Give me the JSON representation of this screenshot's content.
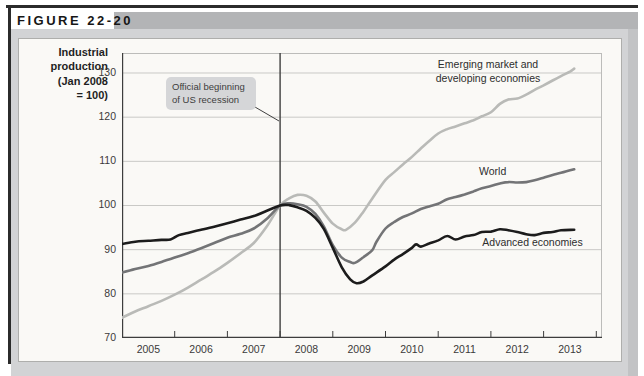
{
  "figure": {
    "label": "FIGURE 22-20"
  },
  "chart": {
    "y_axis_title": "Industrial\nproduction\n(Jan 2008\n= 100)",
    "annotation": "Official beginning\nof US recession"
  },
  "chart_data": {
    "type": "line",
    "title": "",
    "xlabel": "",
    "ylabel": "Industrial production (Jan 2008 = 100)",
    "ylim": [
      70,
      134.5
    ],
    "xlim": [
      2005,
      2014.1
    ],
    "yticks": [
      70,
      80,
      90,
      100,
      110,
      120,
      130
    ],
    "x_ticks": [
      2005,
      2006,
      2007,
      2008,
      2009,
      2010,
      2011,
      2012,
      2013
    ],
    "x_tick_marks": [
      2006,
      2007,
      2008,
      2009,
      2010,
      2011,
      2012,
      2013,
      2014
    ],
    "grid": true,
    "legend_position": "inline-labels",
    "annotations": [
      {
        "text": "Official beginning of US recession",
        "x": 2008.0
      }
    ],
    "series": [
      {
        "name": "Emerging market and developing economies",
        "color": "#b9bab7",
        "width": 2.6,
        "points": [
          [
            2005.0,
            74.6
          ],
          [
            2005.25,
            76.0
          ],
          [
            2005.5,
            77.2
          ],
          [
            2005.75,
            78.4
          ],
          [
            2006.0,
            79.8
          ],
          [
            2006.25,
            81.4
          ],
          [
            2006.5,
            83.2
          ],
          [
            2006.75,
            85.0
          ],
          [
            2007.0,
            87.0
          ],
          [
            2007.25,
            89.2
          ],
          [
            2007.5,
            91.5
          ],
          [
            2007.75,
            95.3
          ],
          [
            2008.0,
            100.0
          ],
          [
            2008.17,
            101.6
          ],
          [
            2008.33,
            102.4
          ],
          [
            2008.5,
            102.2
          ],
          [
            2008.67,
            100.9
          ],
          [
            2008.83,
            98.4
          ],
          [
            2009.0,
            95.9
          ],
          [
            2009.17,
            94.6
          ],
          [
            2009.25,
            94.5
          ],
          [
            2009.42,
            96.1
          ],
          [
            2009.58,
            98.6
          ],
          [
            2009.75,
            101.6
          ],
          [
            2010.0,
            105.8
          ],
          [
            2010.17,
            107.6
          ],
          [
            2010.33,
            109.3
          ],
          [
            2010.5,
            111.0
          ],
          [
            2010.67,
            112.9
          ],
          [
            2010.83,
            114.6
          ],
          [
            2011.0,
            116.3
          ],
          [
            2011.17,
            117.3
          ],
          [
            2011.33,
            117.9
          ],
          [
            2011.5,
            118.6
          ],
          [
            2011.67,
            119.3
          ],
          [
            2011.83,
            120.2
          ],
          [
            2012.0,
            121.1
          ],
          [
            2012.17,
            123.0
          ],
          [
            2012.33,
            124.0
          ],
          [
            2012.5,
            124.2
          ],
          [
            2012.67,
            125.1
          ],
          [
            2012.83,
            126.2
          ],
          [
            2013.0,
            127.2
          ],
          [
            2013.17,
            128.3
          ],
          [
            2013.33,
            129.3
          ],
          [
            2013.5,
            130.3
          ],
          [
            2013.58,
            131.0
          ]
        ]
      },
      {
        "name": "World",
        "color": "#737476",
        "width": 2.6,
        "points": [
          [
            2005.0,
            84.8
          ],
          [
            2005.25,
            85.6
          ],
          [
            2005.5,
            86.3
          ],
          [
            2005.75,
            87.2
          ],
          [
            2006.0,
            88.2
          ],
          [
            2006.25,
            89.2
          ],
          [
            2006.5,
            90.3
          ],
          [
            2006.75,
            91.5
          ],
          [
            2007.0,
            92.7
          ],
          [
            2007.25,
            93.6
          ],
          [
            2007.5,
            94.8
          ],
          [
            2007.75,
            97.0
          ],
          [
            2008.0,
            100.0
          ],
          [
            2008.17,
            100.5
          ],
          [
            2008.33,
            100.3
          ],
          [
            2008.5,
            99.7
          ],
          [
            2008.67,
            98.1
          ],
          [
            2008.83,
            95.3
          ],
          [
            2009.0,
            91.0
          ],
          [
            2009.17,
            88.2
          ],
          [
            2009.33,
            87.2
          ],
          [
            2009.42,
            87.0
          ],
          [
            2009.58,
            88.3
          ],
          [
            2009.75,
            89.9
          ],
          [
            2009.83,
            91.8
          ],
          [
            2010.0,
            94.8
          ],
          [
            2010.17,
            96.3
          ],
          [
            2010.33,
            97.4
          ],
          [
            2010.5,
            98.2
          ],
          [
            2010.67,
            99.2
          ],
          [
            2010.83,
            99.8
          ],
          [
            2011.0,
            100.4
          ],
          [
            2011.17,
            101.4
          ],
          [
            2011.33,
            101.9
          ],
          [
            2011.5,
            102.5
          ],
          [
            2011.67,
            103.2
          ],
          [
            2011.83,
            103.9
          ],
          [
            2012.0,
            104.4
          ],
          [
            2012.17,
            105.0
          ],
          [
            2012.33,
            105.3
          ],
          [
            2012.5,
            105.2
          ],
          [
            2012.67,
            105.3
          ],
          [
            2012.83,
            105.7
          ],
          [
            2013.0,
            106.3
          ],
          [
            2013.17,
            106.9
          ],
          [
            2013.33,
            107.4
          ],
          [
            2013.58,
            108.2
          ]
        ]
      },
      {
        "name": "Advanced economies",
        "color": "#1c1c1c",
        "width": 2.6,
        "points": [
          [
            2005.0,
            91.3
          ],
          [
            2005.25,
            91.8
          ],
          [
            2005.5,
            92.0
          ],
          [
            2005.75,
            92.2
          ],
          [
            2005.92,
            92.3
          ],
          [
            2006.08,
            93.3
          ],
          [
            2006.25,
            93.8
          ],
          [
            2006.5,
            94.5
          ],
          [
            2006.75,
            95.2
          ],
          [
            2007.0,
            96.0
          ],
          [
            2007.25,
            96.8
          ],
          [
            2007.5,
            97.6
          ],
          [
            2007.75,
            98.8
          ],
          [
            2008.0,
            100.0
          ],
          [
            2008.17,
            100.1
          ],
          [
            2008.33,
            99.6
          ],
          [
            2008.5,
            98.8
          ],
          [
            2008.67,
            97.2
          ],
          [
            2008.83,
            94.7
          ],
          [
            2009.0,
            90.4
          ],
          [
            2009.17,
            86.0
          ],
          [
            2009.33,
            83.3
          ],
          [
            2009.45,
            82.4
          ],
          [
            2009.58,
            82.8
          ],
          [
            2009.75,
            84.2
          ],
          [
            2010.0,
            86.2
          ],
          [
            2010.17,
            87.8
          ],
          [
            2010.33,
            89.0
          ],
          [
            2010.5,
            90.4
          ],
          [
            2010.58,
            91.2
          ],
          [
            2010.67,
            90.7
          ],
          [
            2010.83,
            91.4
          ],
          [
            2011.0,
            92.1
          ],
          [
            2011.17,
            93.1
          ],
          [
            2011.33,
            92.3
          ],
          [
            2011.5,
            93.0
          ],
          [
            2011.67,
            93.3
          ],
          [
            2011.83,
            94.0
          ],
          [
            2012.0,
            94.1
          ],
          [
            2012.17,
            94.6
          ],
          [
            2012.33,
            94.4
          ],
          [
            2012.5,
            94.0
          ],
          [
            2012.67,
            93.5
          ],
          [
            2012.83,
            93.3
          ],
          [
            2013.0,
            93.8
          ],
          [
            2013.17,
            94.0
          ],
          [
            2013.33,
            94.4
          ],
          [
            2013.58,
            94.5
          ]
        ]
      }
    ]
  }
}
